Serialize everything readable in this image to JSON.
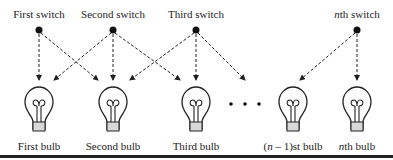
{
  "diagram": {
    "switches": [
      {
        "label": "First switch",
        "x": 39
      },
      {
        "label": "Second switch",
        "x": 113
      },
      {
        "label": "Third switch",
        "x": 196
      },
      {
        "label_prefix": "n",
        "label": "th switch",
        "x": 357
      }
    ],
    "bulbs": [
      {
        "label": "First bulb",
        "x": 39
      },
      {
        "label": "Second bulb",
        "x": 113
      },
      {
        "label": "Third bulb",
        "x": 196
      },
      {
        "label_prefix_open": "(",
        "label_prefix": "n",
        "label_mid": " – 1)st bulb",
        "x": 293
      },
      {
        "label_prefix": "n",
        "label": "th bulb",
        "x": 357
      }
    ],
    "ellipsis": "• • •",
    "connections": [
      {
        "from": "First switch",
        "to": [
          "First bulb",
          "Second bulb"
        ]
      },
      {
        "from": "Second switch",
        "to": [
          "First bulb",
          "Second bulb",
          "Third bulb"
        ]
      },
      {
        "from": "Third switch",
        "to": [
          "Second bulb",
          "Third bulb",
          "(n-1)st bulb"
        ]
      },
      {
        "from": "nth switch",
        "to": [
          "(n-1)st bulb",
          "nth bulb"
        ]
      }
    ]
  }
}
